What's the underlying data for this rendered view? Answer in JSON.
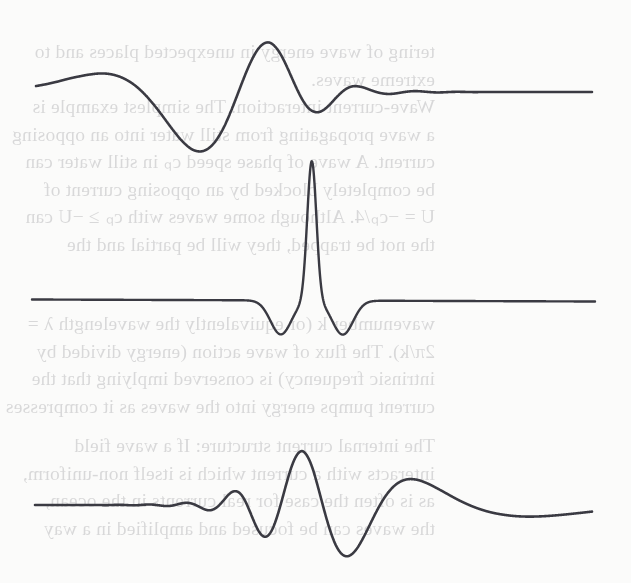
{
  "page": {
    "kind": "scanned-textbook-figure",
    "width": 631,
    "height": 583,
    "background_color": "#fbfbfa",
    "ink_color": "#3a3a42",
    "showthrough_color": "#2a2a33"
  },
  "showthrough_text": {
    "description": "faint mirrored text bleeding through from the reverse side of the scanned page",
    "blocks": [
      {
        "top": 38,
        "left": 196,
        "lines": [
          "tering of wave energy in unexpected places and to",
          "extreme waves."
        ]
      },
      {
        "top": 93,
        "left": 196,
        "lines": [
          "Wave-current interaction: The simplest example is",
          "a wave propagating from still water into an opposing",
          "current. A wave of phase speed cₚ in still water can",
          "be completely blocked by an opposing current of",
          "U = −cₚ/4. Although some waves with cₚ ≥ −U can",
          "the not be trapped, they will be partial and the"
        ]
      },
      {
        "top": 310,
        "left": 196,
        "lines": [
          "wavenumber k (or equivalently the wavelength λ =",
          "2π/k). The flux of wave action (energy divided by",
          "intrinsic frequency) is conserved implying that the",
          "current pumps energy into the waves as it compresses"
        ]
      },
      {
        "top": 432,
        "left": 196,
        "lines": [
          "The internal current structure: If a wave field",
          "interacts with a current which is itself non-uniform,",
          "as is often the case for real currents in the ocean,",
          "the waves can be focused and amplified in a way"
        ]
      }
    ]
  },
  "plots": [
    {
      "id": "upper-chirp",
      "name": "upshifted-chirp-waveform",
      "caption": "",
      "panel_top": 0,
      "panel_height": 178,
      "baseline_y": 92,
      "x_start": 36,
      "x_end": 592,
      "stroke_width": 2.6
    },
    {
      "id": "middle-impulse",
      "name": "focused-impulse-waveform",
      "caption": "",
      "panel_top": 150,
      "panel_height": 200,
      "baseline_y": 148,
      "x_start": 32,
      "x_end": 595,
      "stroke_width": 2.4
    },
    {
      "id": "lower-chirp",
      "name": "downshifted-chirp-waveform",
      "caption": "",
      "panel_top": 400,
      "panel_height": 183,
      "baseline_y": 105,
      "x_start": 35,
      "x_end": 592,
      "stroke_width": 2.6
    }
  ],
  "chart_data": {
    "type": "line",
    "title": "",
    "subtitle": "",
    "xlabel": "",
    "ylabel": "",
    "grid": false,
    "legend": "none",
    "axes_visible": false,
    "tick_labels": [],
    "panels": [
      {
        "name": "upper-chirp",
        "signal": "chirp",
        "description": "Dispersive wave packet: amplitude grows from left, peaks near x=0.51 of the trace, frequency increases to the right until the signal collapses to a flat line.",
        "x_range": [
          0,
          1
        ],
        "y_range": [
          -1.05,
          1.05
        ],
        "envelope_peak_x": 0.505,
        "envelope_peak_y": 1.0,
        "frequency_start_cycles": 1.1,
        "frequency_end_cycles": 34.0,
        "direction": "frequency-increasing",
        "flat_tail_from_x": 0.79,
        "samples_x": [
          0.0,
          0.02,
          0.04,
          0.06,
          0.08,
          0.1,
          0.12,
          0.14,
          0.16,
          0.18,
          0.2,
          0.22,
          0.24,
          0.26,
          0.28,
          0.3,
          0.32,
          0.34,
          0.36,
          0.38,
          0.4,
          0.42,
          0.44,
          0.46,
          0.48,
          0.5,
          0.52,
          0.54,
          0.56,
          0.58,
          0.6,
          0.62,
          0.64,
          0.66,
          0.68,
          0.7,
          0.72,
          0.74,
          0.76,
          0.78,
          0.8,
          0.85,
          0.9,
          0.95,
          1.0
        ],
        "envelope_y": [
          0.1,
          0.13,
          0.17,
          0.22,
          0.27,
          0.33,
          0.4,
          0.47,
          0.54,
          0.62,
          0.69,
          0.76,
          0.83,
          0.89,
          0.94,
          0.97,
          0.99,
          1.0,
          0.98,
          0.94,
          0.88,
          0.8,
          0.7,
          0.59,
          0.48,
          0.37,
          0.28,
          0.2,
          0.14,
          0.09,
          0.06,
          0.04,
          0.03,
          0.02,
          0.015,
          0.01,
          0.008,
          0.005,
          0.003,
          0.002,
          0.001,
          0.0,
          0.0,
          0.0,
          0.0
        ]
      },
      {
        "name": "middle-impulse",
        "signal": "impulse",
        "description": "Fully focused wave: a single tall narrow positive spike at mid-trace flanked by two shallow negative lobes, flat elsewhere.",
        "x_range": [
          0,
          1
        ],
        "y_range": [
          -0.3,
          1.0
        ],
        "spike_x": 0.497,
        "spike_height": 1.0,
        "side_lobe_depth": -0.22,
        "side_lobe_offsets": [
          -0.055,
          0.055
        ],
        "flat_level": 0.0
      },
      {
        "name": "lower-chirp",
        "signal": "chirp",
        "description": "Time-reversed dispersive wave packet: flat on the left, frequency decreases to the right, envelope peaks near x=0.49 of the trace.",
        "x_range": [
          0,
          1
        ],
        "y_range": [
          -1.05,
          1.05
        ],
        "envelope_peak_x": 0.49,
        "envelope_peak_y": 1.0,
        "frequency_start_cycles": 34.0,
        "frequency_end_cycles": 1.1,
        "direction": "frequency-decreasing",
        "flat_tail_to_x": 0.21,
        "samples_x": [
          0.0,
          0.05,
          0.1,
          0.15,
          0.2,
          0.22,
          0.24,
          0.26,
          0.28,
          0.3,
          0.32,
          0.34,
          0.36,
          0.38,
          0.4,
          0.42,
          0.44,
          0.46,
          0.48,
          0.5,
          0.52,
          0.54,
          0.56,
          0.58,
          0.6,
          0.62,
          0.64,
          0.66,
          0.68,
          0.7,
          0.72,
          0.74,
          0.76,
          0.78,
          0.8,
          0.84,
          0.88,
          0.92,
          0.96,
          1.0
        ],
        "envelope_y": [
          0.0,
          0.0,
          0.001,
          0.003,
          0.008,
          0.012,
          0.02,
          0.03,
          0.045,
          0.07,
          0.11,
          0.17,
          0.25,
          0.36,
          0.48,
          0.6,
          0.72,
          0.84,
          0.94,
          1.0,
          0.99,
          0.95,
          0.89,
          0.82,
          0.74,
          0.66,
          0.58,
          0.51,
          0.45,
          0.4,
          0.36,
          0.33,
          0.3,
          0.28,
          0.26,
          0.23,
          0.21,
          0.19,
          0.17,
          0.15
        ]
      }
    ]
  }
}
